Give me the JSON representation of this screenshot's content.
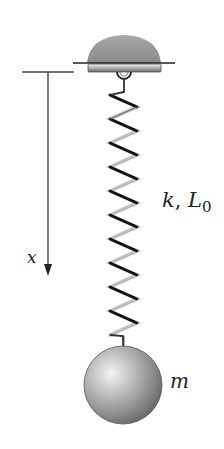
{
  "diagram": {
    "type": "mass-spring system",
    "labels": {
      "x_axis": "x",
      "spring_param_k": "k",
      "spring_sep": ", ",
      "spring_param_L": "L",
      "spring_param_L_sub": "0",
      "mass": "m"
    },
    "elements": [
      {
        "name": "ceiling-mount",
        "shape": "dome"
      },
      {
        "name": "spring",
        "coils": 11
      },
      {
        "name": "mass",
        "shape": "sphere"
      },
      {
        "name": "x-axis-arrow",
        "direction": "down"
      }
    ],
    "colors": {
      "dome": "#9a9a9a",
      "spring_dark": "#111111",
      "spring_light": "#bdbdbd",
      "lines": "#444444"
    }
  }
}
